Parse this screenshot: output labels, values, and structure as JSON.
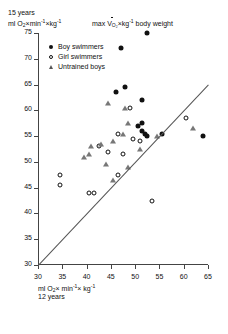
{
  "header": {
    "age_label": "15 years",
    "unit_prefix": "ml O",
    "unit_sub": "2",
    "unit_mid": "×min",
    "unit_sup1": "-1",
    "unit_mid2": "×kg",
    "unit_sup2": "-1",
    "title_pre": "max V",
    "title_sub": "O₂",
    "title_post": "×kg",
    "title_sup": "-1",
    "title_tail": " body weight"
  },
  "legend": {
    "items": [
      {
        "label": "Boy swimmers",
        "marker": "filled-circle"
      },
      {
        "label": "Girl swimmers",
        "marker": "open-circle"
      },
      {
        "label": "Untrained boys",
        "marker": "open-triangle"
      }
    ]
  },
  "footer": {
    "unit_prefix": "ml O",
    "unit_sub": "2",
    "unit_mid": "× min",
    "unit_sup1": "-1",
    "unit_mid2": "× kg",
    "unit_sup2": "-1",
    "age_label": "12 years"
  },
  "chart_data": {
    "type": "scatter",
    "xlabel": "ml O2×min-1×kg-1, 12 years",
    "ylabel": "ml O2×min-1×kg-1, 15 years",
    "xlim": [
      30,
      65
    ],
    "ylim": [
      30,
      75
    ],
    "xticks": [
      30,
      35,
      40,
      45,
      50,
      55,
      60,
      65
    ],
    "yticks": [
      30,
      35,
      40,
      45,
      50,
      55,
      60,
      65,
      70,
      75
    ],
    "grid": false,
    "legend_position": "upper-left",
    "reference_line": {
      "label": "line of identity",
      "x": [
        30,
        65
      ],
      "y": [
        30,
        65
      ]
    },
    "series": [
      {
        "name": "Boy swimmers",
        "marker": "filled-circle",
        "color": "#111111",
        "points": [
          [
            47.0,
            72.0
          ],
          [
            52.5,
            75.0
          ],
          [
            46.0,
            63.5
          ],
          [
            48.0,
            64.5
          ],
          [
            51.5,
            62.0
          ],
          [
            50.5,
            57.0
          ],
          [
            51.5,
            57.5
          ],
          [
            51.5,
            56.0
          ],
          [
            52.0,
            55.5
          ],
          [
            52.5,
            55.0
          ],
          [
            55.5,
            55.5
          ],
          [
            64.0,
            55.0
          ]
        ]
      },
      {
        "name": "Girl swimmers",
        "marker": "open-circle",
        "color": "#111111",
        "points": [
          [
            49.0,
            60.5
          ],
          [
            46.5,
            55.5
          ],
          [
            49.5,
            54.5
          ],
          [
            51.0,
            54.0
          ],
          [
            42.5,
            53.0
          ],
          [
            44.5,
            52.0
          ],
          [
            47.5,
            51.5
          ],
          [
            34.5,
            47.5
          ],
          [
            34.5,
            45.5
          ],
          [
            40.5,
            44.0
          ],
          [
            41.5,
            44.0
          ],
          [
            46.5,
            47.5
          ],
          [
            53.5,
            42.5
          ],
          [
            60.5,
            58.5
          ]
        ]
      },
      {
        "name": "Untrained boys",
        "marker": "open-triangle",
        "color": "#777777",
        "points": [
          [
            44.5,
            61.5
          ],
          [
            48.0,
            60.5
          ],
          [
            48.5,
            57.5
          ],
          [
            47.5,
            55.5
          ],
          [
            41.0,
            53.0
          ],
          [
            43.0,
            53.5
          ],
          [
            39.5,
            51.0
          ],
          [
            40.5,
            51.5
          ],
          [
            45.5,
            54.0
          ],
          [
            44.0,
            49.5
          ],
          [
            48.5,
            49.0
          ],
          [
            51.0,
            52.5
          ],
          [
            54.5,
            55.0
          ],
          [
            62.0,
            56.5
          ],
          [
            45.5,
            46.5
          ]
        ]
      }
    ]
  }
}
